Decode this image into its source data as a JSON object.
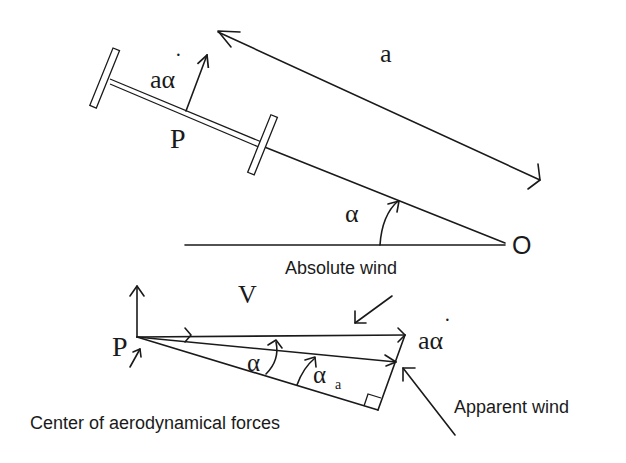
{
  "diagram": {
    "labels": {
      "arm_length": "a",
      "rotation_speed": "aα̇",
      "rotation_speed_base": "aα",
      "dot": "·",
      "pivot_point": "P",
      "origin": "O",
      "angle": "α",
      "velocity": "V",
      "apparent_angle_base": "α",
      "apparent_angle_sub": "a",
      "absolute_wind": "Absolute wind",
      "apparent_wind": "Apparent wind",
      "center_forces": "Center of aerodynamical forces"
    },
    "colors": {
      "ink": "#1a1a1a",
      "background": "#ffffff"
    }
  }
}
